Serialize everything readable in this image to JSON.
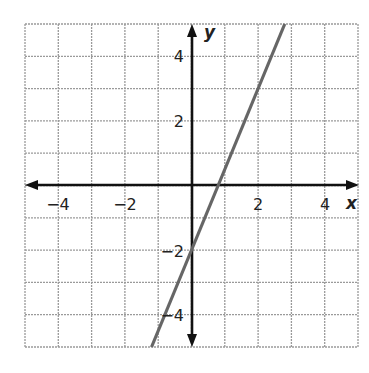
{
  "chart_data": {
    "type": "line",
    "title": "",
    "xlabel": "x",
    "ylabel": "y",
    "xlim": [
      -5,
      5
    ],
    "ylim": [
      -5,
      5
    ],
    "grid": true,
    "x_ticks": [
      -4,
      -2,
      2,
      4
    ],
    "y_ticks": [
      -4,
      -2,
      2,
      4
    ],
    "x_tick_labels": [
      "−4",
      "−2",
      "2",
      "4"
    ],
    "y_tick_labels": [
      "−4",
      "−2",
      "2",
      "4"
    ],
    "series": [
      {
        "name": "line",
        "equation": "y = 2.5x - 2",
        "x": [
          -1.2,
          2.8
        ],
        "y": [
          -5,
          5
        ],
        "color": "#666666"
      }
    ]
  },
  "labels": {
    "x_axis": "x",
    "y_axis": "y",
    "xt_m4": "−4",
    "xt_m2": "−2",
    "xt_2": "2",
    "xt_4": "4",
    "yt_4": "4",
    "yt_2": "2",
    "yt_m2": "−2",
    "yt_m4": "−4"
  }
}
